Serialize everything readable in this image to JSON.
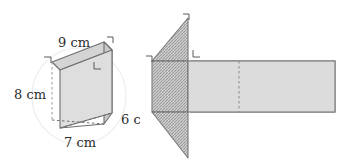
{
  "figure": {
    "background_color": "#ffffff",
    "arrow": {
      "icon": "arrow-right-icon",
      "color": "#8c8c8c"
    },
    "solid": {
      "name": "triangular-prism",
      "labels": [
        {
          "id": "top-edge",
          "text": "9 cm",
          "value": 9,
          "unit": "cm"
        },
        {
          "id": "left-height",
          "text": "8 cm",
          "value": 8,
          "unit": "cm"
        },
        {
          "id": "bottom-edge",
          "text": "7 cm",
          "value": 7,
          "unit": "cm"
        },
        {
          "id": "depth-edge",
          "text": "6 cm",
          "value": 6,
          "unit": "cm"
        }
      ],
      "face_color": "#d9d9d9",
      "edge_color": "#6e6e6e",
      "hidden_edge_style": "dashed",
      "right_angle_marks": 3
    },
    "net": {
      "name": "prism-net",
      "triangle_fill": "#c4c4c4",
      "triangle_pattern": "hatch",
      "rectangle_fill": "#dcdcdc",
      "edge_color": "#6e6e6e",
      "fold_line_style": "dashed",
      "rectangle_count": 3,
      "triangle_count": 2,
      "right_angle_marks": 3
    }
  }
}
